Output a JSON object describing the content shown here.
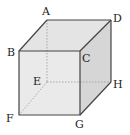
{
  "diagram": {
    "type": "cube",
    "vertices": {
      "A": {
        "label": "A",
        "x": 47,
        "y": 20
      },
      "B": {
        "label": "B",
        "x": 19,
        "y": 51
      },
      "C": {
        "label": "C",
        "x": 80,
        "y": 51
      },
      "D": {
        "label": "D",
        "x": 111,
        "y": 20
      },
      "E": {
        "label": "E",
        "x": 47,
        "y": 82
      },
      "F": {
        "label": "F",
        "x": 19,
        "y": 115
      },
      "G": {
        "label": "G",
        "x": 80,
        "y": 115
      },
      "H": {
        "label": "H",
        "x": 111,
        "y": 82
      }
    },
    "colors": {
      "front_face": "#eaeaea",
      "top_face": "#e4e4e4",
      "side_face": "#d6d6d6",
      "edge": "#444444",
      "hidden_edge": "#9a9a9a"
    }
  }
}
